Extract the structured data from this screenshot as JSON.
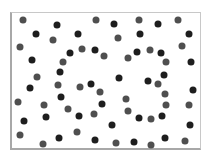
{
  "figure": {
    "colors": {
      "background": "#ffffff",
      "border": "#a8a8a8",
      "dot_gray": "#4f4f4f",
      "dot_dark": "#1e1e1e"
    },
    "frame": {
      "left": 10,
      "top": 12,
      "right": 201,
      "bottom": 150
    },
    "dot_diameter": 7,
    "dots": [
      [
        23,
        20,
        "g"
      ],
      [
        96,
        20,
        "g"
      ],
      [
        139,
        20,
        "g"
      ],
      [
        178,
        20,
        "g"
      ],
      [
        57,
        25,
        "d"
      ],
      [
        114,
        24,
        "d"
      ],
      [
        158,
        24,
        "d"
      ],
      [
        36,
        34,
        "d"
      ],
      [
        78,
        34,
        "d"
      ],
      [
        140,
        34,
        "d"
      ],
      [
        189,
        34,
        "d"
      ],
      [
        53,
        40,
        "g"
      ],
      [
        118,
        38,
        "g"
      ],
      [
        20,
        47,
        "g"
      ],
      [
        182,
        46,
        "g"
      ],
      [
        82,
        49,
        "g"
      ],
      [
        95,
        50,
        "d"
      ],
      [
        70,
        53,
        "d"
      ],
      [
        137,
        52,
        "d"
      ],
      [
        150,
        50,
        "g"
      ],
      [
        161,
        53,
        "d"
      ],
      [
        104,
        56,
        "g"
      ],
      [
        128,
        58,
        "g"
      ],
      [
        32,
        60,
        "d"
      ],
      [
        63,
        62,
        "g"
      ],
      [
        166,
        62,
        "g"
      ],
      [
        191,
        62,
        "d"
      ],
      [
        60,
        72,
        "d"
      ],
      [
        164,
        75,
        "d"
      ],
      [
        37,
        77,
        "g"
      ],
      [
        119,
        78,
        "d"
      ],
      [
        148,
        81,
        "d"
      ],
      [
        58,
        85,
        "g"
      ],
      [
        91,
        84,
        "d"
      ],
      [
        80,
        87,
        "g"
      ],
      [
        158,
        84,
        "g"
      ],
      [
        30,
        88,
        "d"
      ],
      [
        193,
        90,
        "d"
      ],
      [
        100,
        92,
        "g"
      ],
      [
        165,
        94,
        "g"
      ],
      [
        61,
        97,
        "d"
      ],
      [
        126,
        99,
        "g"
      ],
      [
        18,
        102,
        "g"
      ],
      [
        44,
        105,
        "g"
      ],
      [
        102,
        104,
        "d"
      ],
      [
        166,
        105,
        "g"
      ],
      [
        189,
        105,
        "g"
      ],
      [
        68,
        109,
        "g"
      ],
      [
        128,
        111,
        "g"
      ],
      [
        79,
        116,
        "d"
      ],
      [
        94,
        114,
        "g"
      ],
      [
        46,
        117,
        "d"
      ],
      [
        139,
        118,
        "d"
      ],
      [
        151,
        119,
        "g"
      ],
      [
        162,
        116,
        "d"
      ],
      [
        24,
        121,
        "d"
      ],
      [
        112,
        125,
        "d"
      ],
      [
        190,
        125,
        "d"
      ],
      [
        20,
        135,
        "g"
      ],
      [
        77,
        132,
        "g"
      ],
      [
        59,
        138,
        "d"
      ],
      [
        95,
        140,
        "d"
      ],
      [
        165,
        138,
        "d"
      ],
      [
        43,
        144,
        "g"
      ],
      [
        116,
        143,
        "g"
      ],
      [
        134,
        142,
        "d"
      ],
      [
        151,
        145,
        "g"
      ],
      [
        185,
        141,
        "g"
      ]
    ],
    "dot_count": 64
  }
}
